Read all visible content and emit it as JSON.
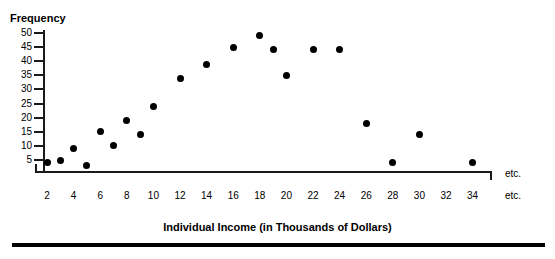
{
  "top_caption": "",
  "y_axis": {
    "title": "Frequency",
    "ticks": [
      5,
      10,
      15,
      20,
      25,
      30,
      35,
      40,
      45,
      50
    ]
  },
  "x_axis": {
    "title": "Individual Income (in Thousands of Dollars)",
    "ticks": [
      2,
      4,
      6,
      8,
      10,
      12,
      14,
      16,
      18,
      20,
      22,
      24,
      26,
      28,
      30,
      32,
      34
    ],
    "etc_label_top": "etc.",
    "etc_label_bottom": "etc."
  },
  "colors": {
    "dot": "#000000",
    "axis": "#1a1a1a",
    "rule": "#000000",
    "background": "#ffffff"
  },
  "chart_data": {
    "type": "scatter",
    "title": "",
    "xlabel": "Individual Income (in Thousands of Dollars)",
    "ylabel": "Frequency",
    "xlim": [
      1,
      35
    ],
    "ylim": [
      0,
      52
    ],
    "grid": false,
    "legend": null,
    "xticks": [
      2,
      4,
      6,
      8,
      10,
      12,
      14,
      16,
      18,
      20,
      22,
      24,
      26,
      28,
      30,
      32,
      34
    ],
    "yticks": [
      5,
      10,
      15,
      20,
      25,
      30,
      35,
      40,
      45,
      50
    ],
    "points": [
      {
        "x": 2,
        "y": 4
      },
      {
        "x": 3,
        "y": 5
      },
      {
        "x": 4,
        "y": 9
      },
      {
        "x": 5,
        "y": 3
      },
      {
        "x": 6,
        "y": 15
      },
      {
        "x": 7,
        "y": 10
      },
      {
        "x": 8,
        "y": 19
      },
      {
        "x": 9,
        "y": 14
      },
      {
        "x": 10,
        "y": 24
      },
      {
        "x": 12,
        "y": 34
      },
      {
        "x": 14,
        "y": 39
      },
      {
        "x": 16,
        "y": 45
      },
      {
        "x": 18,
        "y": 49
      },
      {
        "x": 19,
        "y": 44
      },
      {
        "x": 20,
        "y": 35
      },
      {
        "x": 22,
        "y": 44
      },
      {
        "x": 24,
        "y": 44
      },
      {
        "x": 26,
        "y": 18
      },
      {
        "x": 28,
        "y": 4
      },
      {
        "x": 30,
        "y": 14
      },
      {
        "x": 34,
        "y": 4
      }
    ]
  }
}
